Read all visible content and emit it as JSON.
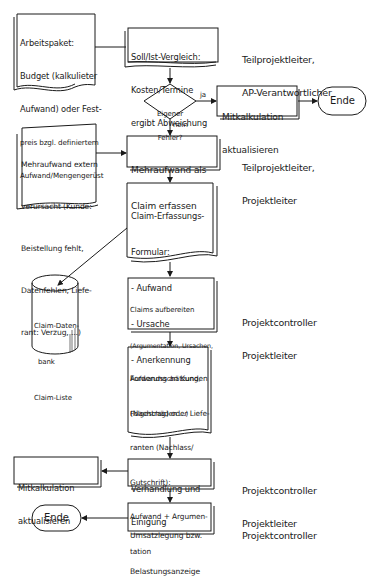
{
  "diagram": {
    "type": "flowchart",
    "nodes": {
      "arbeitspaket": {
        "shape": "document",
        "lines": [
          "Arbeitspaket:",
          "Budget (kalkulieter",
          "Aufwand) oder Fest-",
          "preis bzgl. definiertem",
          "Aufwand/Mengengerüst"
        ]
      },
      "soll_ist": {
        "shape": "document",
        "lines": [
          "Soll/Ist-Vergleich:",
          "Kosten/Termine",
          "ergibt Abweichung"
        ]
      },
      "decision": {
        "shape": "diamond",
        "lines": [
          "Eigener",
          "Fehler?"
        ]
      },
      "mitkalk_top": {
        "shape": "process",
        "lines": [
          "Mitkalkulation",
          "aktualisieren"
        ]
      },
      "ende_top": {
        "shape": "terminator",
        "label": "Ende"
      },
      "mehraufwand_extern": {
        "shape": "document",
        "lines": [
          "Mehraufwand extern",
          "verursacht (Kunde:",
          "Beistellung fehlt,",
          "Datenfehlen, Liefe-",
          "rant: Verzug, ...)"
        ]
      },
      "mehraufwand_claim": {
        "shape": "process",
        "lines": [
          "Mehraufwand als",
          "Claim erfassen"
        ]
      },
      "claim_formular": {
        "shape": "document",
        "lines": [
          "Claim-Erfassungs-",
          "Formular:",
          "- Aufwand",
          "- Ursache",
          "- Anerkennung"
        ]
      },
      "claim_db": {
        "shape": "database",
        "lines": [
          "Claim-Daten-",
          "bank",
          "Claim-Liste"
        ]
      },
      "claims_aufbereiten": {
        "shape": "document",
        "lines": [
          "Claims aufbereiten",
          "(Argumentation, Ursachen,",
          "Aufwandsschätzung,",
          "Folgeschäden ...)"
        ]
      },
      "forderung": {
        "shape": "document",
        "lines": [
          "Forderung an Kunden",
          "(Nachtrag) oder Liefe-",
          "ranten (Nachlass/",
          "Gutschrift):",
          "Aufwand + Argumen-",
          "tation"
        ]
      },
      "verhandlung": {
        "shape": "process",
        "lines": [
          "Verhandlung und",
          "Einigung"
        ]
      },
      "mitkalk_bottom": {
        "shape": "process",
        "lines": [
          "Mitkalkulation",
          "aktualisieren"
        ]
      },
      "umsatzlegung": {
        "shape": "process",
        "lines": [
          "Umsatzlegung bzw.",
          "Belastungsanzeige"
        ]
      },
      "ende_bottom": {
        "shape": "terminator",
        "label": "Ende"
      }
    },
    "edge_labels": {
      "yes": "ja",
      "no": "nein"
    },
    "roles": [
      {
        "for": "soll_ist",
        "lines": [
          "Teilprojektleiter,",
          "AP-Verantwortlicher"
        ]
      },
      {
        "for": "mehraufwand_claim",
        "lines": [
          "Teilprojektleiter,",
          "Projektleiter"
        ]
      },
      {
        "for": "claims_aufbereiten",
        "lines": [
          "Projektcontroller",
          "Projektleiter"
        ]
      },
      {
        "for": "verhandlung",
        "lines": [
          "Projektcontroller",
          "Projektleiter"
        ]
      },
      {
        "for": "umsatzlegung",
        "lines": [
          "Projektcontroller"
        ]
      }
    ],
    "edges": [
      {
        "from": "arbeitspaket",
        "to": "soll_ist"
      },
      {
        "from": "soll_ist",
        "to": "decision"
      },
      {
        "from": "decision",
        "to": "mitkalk_top",
        "label": "ja"
      },
      {
        "from": "mitkalk_top",
        "to": "ende_top"
      },
      {
        "from": "decision",
        "to": "mehraufwand_claim",
        "label": "nein"
      },
      {
        "from": "mehraufwand_extern",
        "to": "mehraufwand_claim"
      },
      {
        "from": "mehraufwand_claim",
        "to": "claim_formular"
      },
      {
        "from": "claim_formular",
        "to": "claim_db"
      },
      {
        "from": "claim_formular",
        "to": "claims_aufbereiten"
      },
      {
        "from": "claims_aufbereiten",
        "to": "forderung"
      },
      {
        "from": "forderung",
        "to": "verhandlung"
      },
      {
        "from": "verhandlung",
        "to": "mitkalk_bottom"
      },
      {
        "from": "verhandlung",
        "to": "umsatzlegung"
      },
      {
        "from": "umsatzlegung",
        "to": "ende_bottom"
      }
    ],
    "colors": {
      "ink": "#1a1a1a",
      "paper": "#ffffff"
    }
  }
}
